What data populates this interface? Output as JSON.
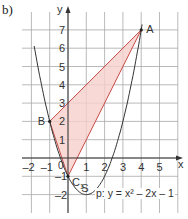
{
  "part_label": "b)",
  "axes": {
    "x_label": "x",
    "y_label": "y",
    "x_ticks": [
      "-2",
      "-1",
      "1",
      "2",
      "3",
      "4",
      "5"
    ],
    "y_ticks": [
      "-2",
      "-1",
      "1",
      "2",
      "3",
      "4",
      "5",
      "6",
      "7"
    ],
    "origin_label": "0"
  },
  "points": {
    "A": {
      "label": "A",
      "x": 4,
      "y": 7
    },
    "B": {
      "label": "B",
      "x": -1,
      "y": 2
    },
    "C1": {
      "label": "C",
      "sub": "1",
      "x": 0,
      "y": -1
    },
    "S": {
      "label": "S",
      "x": 1,
      "y": -2
    }
  },
  "curve_label": "p: y = x² – 2x – 1",
  "colors": {
    "grid": "#9a9a9a",
    "curve": "#333333",
    "triangle_fill": "#f6cfcc",
    "triangle_stroke": "#c94a44"
  }
}
